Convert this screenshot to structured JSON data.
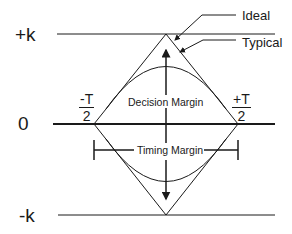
{
  "diagram": {
    "type": "eye-diagram",
    "axis_labels": {
      "top": "+k",
      "middle": "0",
      "bottom": "-k"
    },
    "time_labels": {
      "left": {
        "numerator": "-T",
        "denominator": "2"
      },
      "right": {
        "numerator": "+T",
        "denominator": "2"
      }
    },
    "callouts": {
      "ideal": "Ideal",
      "typical": "Typical"
    },
    "margins": {
      "decision": "Decision Margin",
      "timing": "Timing Margin"
    },
    "colors": {
      "line": "#1a1a1a",
      "background": "#ffffff"
    }
  }
}
